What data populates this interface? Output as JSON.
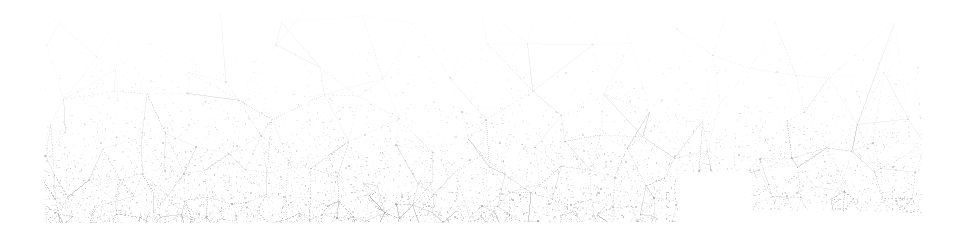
{
  "image": {
    "width": 959,
    "height": 242,
    "background_color": "#ffffff",
    "content_type": "triangulated-mesh-network",
    "description": "Faint low-contrast dithered triangular mesh band on white background",
    "has_text": false
  },
  "band": {
    "name": "mesh-band",
    "left_edge_x": 44,
    "right_edge_x": 922,
    "top_edge_y_left": 18,
    "top_edge_y_mid": 14,
    "top_edge_y_right": 24,
    "bottom_edge_y_left": 223,
    "bottom_edge_y_right": 213,
    "outline_points": "44,20 120,14 360,10 620,13 860,20 922,26 922,213 752,210 750,172 680,172 678,222 44,223"
  },
  "notch": {
    "name": "bottom-rectangular-notch",
    "x": 678,
    "y": 172,
    "width": 72,
    "height": 51,
    "fill": "#ffffff"
  },
  "palette": {
    "background": "#ffffff",
    "line_lightest": "#dcdcdc",
    "line_light": "#cccccc",
    "line_mid": "#b4b4b4",
    "line_dark": "#9a9a9a",
    "node_color": "#8e8e8e"
  },
  "density": {
    "description": "Mesh density and darkness increase from sparse at top to very dense at bottom",
    "top_opacity": 0.22,
    "mid_opacity": 0.38,
    "bottom_opacity": 0.62,
    "top_cell_size": 58,
    "bottom_cell_size": 13
  },
  "chart_data": {
    "type": "scatter",
    "title": "",
    "subtitle": "",
    "xlabel": "",
    "ylabel": "",
    "grid": false,
    "legend": null,
    "xlim": [
      44,
      922
    ],
    "ylim": [
      14,
      223
    ],
    "annotations": [],
    "series": [
      {
        "name": "mesh-edges",
        "description": "Straight thin segments connecting mesh vertices, Delaunay-like triangulation",
        "values": []
      },
      {
        "name": "mesh-vertices",
        "description": "Small node points at segment intersections",
        "values": []
      }
    ]
  }
}
